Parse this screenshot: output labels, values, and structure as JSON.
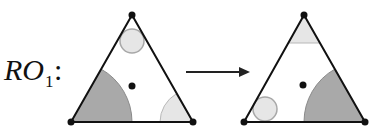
{
  "label": {
    "main": "RO",
    "subscript": "1",
    "colon": ":"
  },
  "colors": {
    "outline": "#111111",
    "dark_fill": "#a9a9a9",
    "dark_stroke": "#8a8a8a",
    "light_fill": "#e6e6e6",
    "light_stroke": "#b8b8b8",
    "background": "#ffffff"
  },
  "left_triangle": {
    "vertices": [
      [
        132,
        15
      ],
      [
        71,
        122
      ],
      [
        193,
        122
      ]
    ],
    "center_dot": [
      132,
      86
    ],
    "dark_sector": {
      "corner": "bottom-left",
      "radius": 61
    },
    "light_sector": {
      "corner": "bottom-right",
      "radius": 33
    },
    "circle": {
      "corner": "top",
      "center": [
        132,
        41
      ],
      "radius": 12
    }
  },
  "arrow": {
    "from": [
      185,
      72
    ],
    "to": [
      250,
      72
    ],
    "direction": "right"
  },
  "right_triangle": {
    "vertices": [
      [
        304,
        15
      ],
      [
        244,
        122
      ],
      [
        365,
        122
      ]
    ],
    "center_dot": [
      303,
      85
    ],
    "dark_sector": {
      "corner": "bottom-right",
      "radius": 61
    },
    "light_sector": {
      "corner": "top",
      "cut_y": 43
    },
    "circle": {
      "corner": "bottom-left",
      "center": [
        265,
        109
      ],
      "radius": 12
    }
  }
}
